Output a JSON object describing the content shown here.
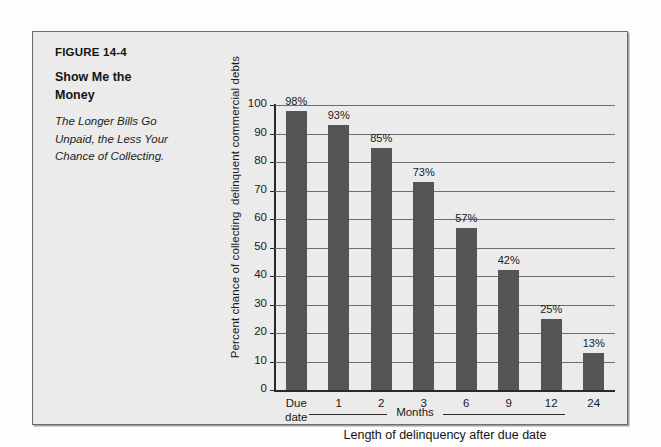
{
  "figure": {
    "number": "FIGURE 14-4",
    "subtitle": "The Longer Bills Go Unpaid, the Less Your Chance of Collecting."
  },
  "colors": {
    "bar": "#555555",
    "panel_background": "#ebebeb",
    "grid": "#6e6e6e",
    "axis": "#2a2a2a",
    "text": "#1a1a1a"
  },
  "chart_data": {
    "type": "bar",
    "subtitle": "The Longer Bills Go Unpaid, the Less Your Chance of Collecting.",
    "categories": [
      "Due date",
      "1",
      "2",
      "3",
      "6",
      "9",
      "12",
      "24"
    ],
    "values": [
      98,
      93,
      85,
      73,
      57,
      42,
      25,
      13
    ],
    "data_labels": [
      "98%",
      "93%",
      "85%",
      "73%",
      "57%",
      "42%",
      "25%",
      "13%"
    ],
    "xlabel": "Length of delinquency after due date",
    "ylabel": "Percent chance of collecting  delinquent commercial debts",
    "group_bracket_label": "Months",
    "group_bracket_categories": [
      "1",
      "2",
      "3",
      "6",
      "9",
      "12",
      "24"
    ],
    "ylim": [
      0,
      100
    ],
    "yticks": [
      0,
      10,
      20,
      30,
      40,
      50,
      60,
      70,
      80,
      90,
      100
    ],
    "ytick_labels": [
      "0",
      "10",
      "20",
      "30",
      "40",
      "50",
      "60",
      "70",
      "80",
      "90",
      "100"
    ],
    "grid": true,
    "grid_axis": "y",
    "legend": false
  }
}
